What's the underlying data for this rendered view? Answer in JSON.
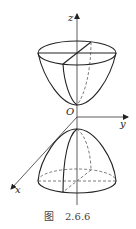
{
  "figure": {
    "axis_labels": {
      "z": "z",
      "y": "y",
      "x": "x",
      "origin": "O"
    },
    "caption": {
      "prefix": "图",
      "number": "2.6.6"
    }
  }
}
